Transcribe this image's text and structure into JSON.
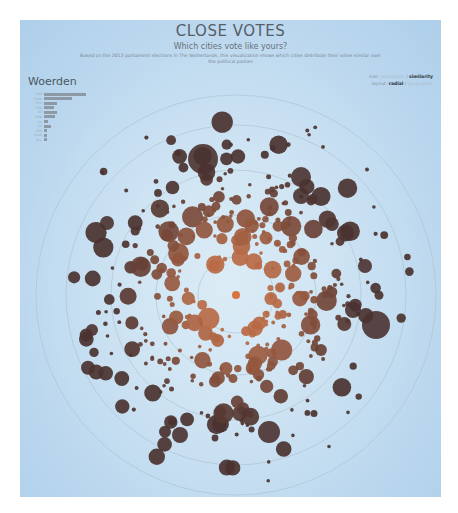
{
  "header": {
    "title": "CLOSE VOTES",
    "subtitle": "Which cities vote like yours?",
    "description": "Based on the 2012 parliament elections in The Netherlands, this visualization shows which cities distribute their votes similar over the political parties"
  },
  "selected_city": {
    "name": "Woerden",
    "party_bars": [
      {
        "label": "VVD",
        "value": 30
      },
      {
        "label": "PvdA",
        "value": 20
      },
      {
        "label": "PVV",
        "value": 9
      },
      {
        "label": "CDA",
        "value": 7
      },
      {
        "label": "SP",
        "value": 9
      },
      {
        "label": "D66",
        "value": 8
      },
      {
        "label": "GL",
        "value": 3
      },
      {
        "label": "CU",
        "value": 5
      },
      {
        "label": "SGP",
        "value": 2
      },
      {
        "label": "PvdD",
        "value": 2
      },
      {
        "label": "50+",
        "value": 2
      }
    ]
  },
  "controls": {
    "size_label": "size:",
    "size_option_1": "population",
    "size_separator": " / ",
    "size_option_2": "similarity",
    "layout_label": "layout:",
    "layout_option_1": "radial",
    "layout_separator": " / ",
    "layout_option_2": "geographic"
  },
  "colors": {
    "center_city": "#d9733f",
    "near_city": "#b86a45",
    "far_city": "#4a3230",
    "ring": "#a9bfcf"
  },
  "chart_data": {
    "type": "scatter",
    "title": "CLOSE VOTES",
    "subtitle": "Which cities vote like yours?",
    "layout": "radial",
    "size_encoding": "similarity",
    "center": {
      "x": 216,
      "y": 275,
      "label": "Woerden"
    },
    "rings_radius": [
      38,
      80,
      125,
      170,
      200
    ],
    "points_note": "Each bubble is a Dutch municipality; distance from center = voting dissimilarity to Woerden; bubbles cluster in annulus r≈70–170",
    "bubble_count_approx": 400
  }
}
